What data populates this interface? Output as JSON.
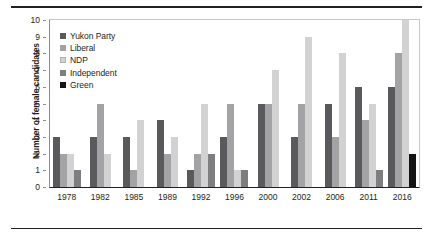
{
  "chart_data": {
    "type": "bar",
    "title": "",
    "xlabel": "",
    "ylabel": "Number of female candidates",
    "ylim": [
      0,
      10
    ],
    "ytick_labels": [
      "0",
      "1",
      "2",
      "3",
      "4",
      "5",
      "6",
      "7",
      "8",
      "9",
      "10"
    ],
    "grid": false,
    "legend_position": "top-left",
    "categories": [
      "1978",
      "1982",
      "1985",
      "1989",
      "1992",
      "1996",
      "2000",
      "2002",
      "2006",
      "2011",
      "2016"
    ],
    "series": [
      {
        "name": "Yukon Party",
        "color": "#5a5a5c",
        "values": [
          3,
          3,
          3,
          4,
          1,
          3,
          5,
          3,
          5,
          6,
          6
        ]
      },
      {
        "name": "Liberal",
        "color": "#a3a3a5",
        "values": [
          2,
          5,
          1,
          2,
          2,
          5,
          5,
          5,
          3,
          4,
          8
        ]
      },
      {
        "name": "NDP",
        "color": "#d2d2d2",
        "values": [
          2,
          2,
          4,
          3,
          5,
          1,
          7,
          9,
          8,
          5,
          10
        ]
      },
      {
        "name": "Independent",
        "color": "#7e7e80",
        "values": [
          1,
          0,
          0,
          0,
          2,
          1,
          0,
          0,
          0,
          1,
          0
        ]
      },
      {
        "name": "Green",
        "color": "#141414",
        "values": [
          0,
          0,
          0,
          0,
          0,
          0,
          0,
          0,
          0,
          0,
          2
        ]
      }
    ]
  }
}
